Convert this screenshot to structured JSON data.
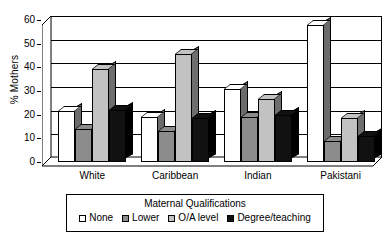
{
  "chart_data": {
    "type": "bar",
    "title": "",
    "xlabel": "",
    "ylabel": "% Mothers",
    "ylim": [
      0,
      60
    ],
    "yticks": [
      0,
      10,
      20,
      30,
      40,
      50,
      60
    ],
    "grid": true,
    "legend_position": "bottom",
    "legend_title": "Maternal Qualifications",
    "categories": [
      "White",
      "Caribbean",
      "Indian",
      "Pakistani"
    ],
    "series": [
      {
        "name": "None",
        "color": "#ffffff",
        "values": [
          21.5,
          19,
          31,
          58
        ]
      },
      {
        "name": "Lower",
        "color": "#8c8c8c",
        "values": [
          14,
          13,
          19,
          9
        ]
      },
      {
        "name": "O/A level",
        "color": "#c2c2c2",
        "values": [
          39.5,
          45.5,
          26.5,
          18.5
        ]
      },
      {
        "name": "Degree/teaching",
        "color": "#111111",
        "values": [
          22,
          18.5,
          20,
          11
        ]
      }
    ]
  },
  "axis": {
    "y_title": "% Mothers",
    "ticks": [
      "0",
      "10",
      "20",
      "30",
      "40",
      "50",
      "60"
    ]
  },
  "categories": [
    "White",
    "Caribbean",
    "Indian",
    "Pakistani"
  ],
  "legend": {
    "title": "Maternal Qualifications",
    "items": [
      {
        "label": "None",
        "swatch": "swatch-none"
      },
      {
        "label": "Lower",
        "swatch": "swatch-lower"
      },
      {
        "label": "O/A level",
        "swatch": "swatch-oa"
      },
      {
        "label": "Degree/teaching",
        "swatch": "swatch-degree"
      }
    ]
  }
}
